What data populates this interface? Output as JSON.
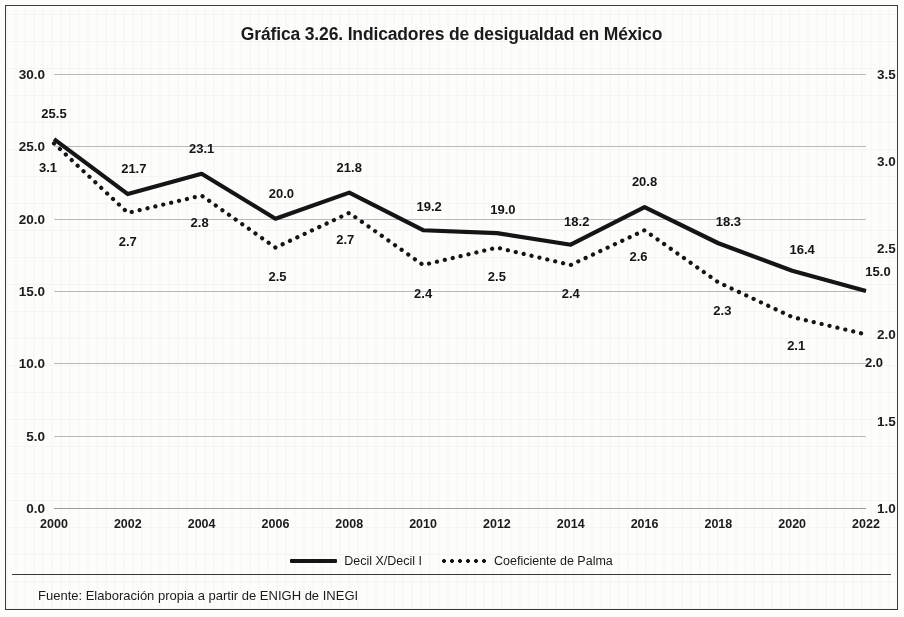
{
  "figure": {
    "title": "Gráfica 3.26. Indicadores de desigualdad en México",
    "source": "Fuente: Elaboración propia a partir de ENIGH de INEGI"
  },
  "legend": {
    "items": [
      {
        "label": "Decil X/Decil I",
        "marker": "solid-line-swatch",
        "color": "#151515"
      },
      {
        "label": "Coeficiente de Palma",
        "marker": "dotted-line-swatch",
        "color": "#151515"
      }
    ]
  },
  "chart_data": {
    "type": "line",
    "title": "Gráfica 3.26. Indicadores de desigualdad en México",
    "xlabel": "",
    "ylabel": "",
    "grid": true,
    "legend_position": "bottom",
    "x": [
      2000,
      2002,
      2004,
      2006,
      2008,
      2010,
      2012,
      2014,
      2016,
      2018,
      2020,
      2022
    ],
    "categories": [
      "2000",
      "2002",
      "2004",
      "2006",
      "2008",
      "2010",
      "2012",
      "2014",
      "2016",
      "2018",
      "2020",
      "2022"
    ],
    "axes": {
      "left": {
        "ylim": [
          0.0,
          30.0
        ],
        "ticks": [
          0.0,
          5.0,
          10.0,
          15.0,
          20.0,
          25.0,
          30.0
        ],
        "tick_labels": [
          "0.0",
          "5.0",
          "10.0",
          "15.0",
          "20.0",
          "25.0",
          "30.0"
        ]
      },
      "right": {
        "ylim": [
          1.0,
          3.5
        ],
        "ticks": [
          1.0,
          1.5,
          2.0,
          2.5,
          3.0,
          3.5
        ],
        "tick_labels": [
          "1.0",
          "1.5",
          "2.0",
          "2.5",
          "3.0",
          "3.5"
        ]
      }
    },
    "series": [
      {
        "name": "Decil X/Decil I",
        "axis": "left",
        "style": "solid",
        "color": "#151515",
        "values": [
          25.5,
          21.7,
          23.1,
          20.0,
          21.8,
          19.2,
          19.0,
          18.2,
          20.8,
          18.3,
          16.4,
          15.0
        ],
        "labels": [
          "25.5",
          "21.7",
          "23.1",
          "20.0",
          "21.8",
          "19.2",
          "19.0",
          "18.2",
          "20.8",
          "18.3",
          "16.4",
          "15.0"
        ],
        "label_offsets": [
          [
            0,
            -26
          ],
          [
            6,
            -26
          ],
          [
            0,
            -26
          ],
          [
            6,
            -26
          ],
          [
            0,
            -26
          ],
          [
            6,
            -24
          ],
          [
            6,
            -24
          ],
          [
            6,
            -24
          ],
          [
            0,
            -26
          ],
          [
            10,
            -22
          ],
          [
            10,
            -22
          ],
          [
            12,
            -20
          ]
        ]
      },
      {
        "name": "Coeficiente de Palma",
        "axis": "right",
        "style": "dotted",
        "color": "#151515",
        "values": [
          3.1,
          2.7,
          2.8,
          2.5,
          2.7,
          2.4,
          2.5,
          2.4,
          2.6,
          2.3,
          2.1,
          2.0
        ],
        "labels": [
          "3.1",
          "2.7",
          "2.8",
          "2.5",
          "2.7",
          "2.4",
          "2.5",
          "2.4",
          "2.6",
          "2.3",
          "2.1",
          "2.0"
        ],
        "label_offsets": [
          [
            -6,
            24
          ],
          [
            0,
            28
          ],
          [
            -2,
            26
          ],
          [
            2,
            28
          ],
          [
            -4,
            26
          ],
          [
            0,
            28
          ],
          [
            0,
            28
          ],
          [
            0,
            28
          ],
          [
            -6,
            26
          ],
          [
            4,
            28
          ],
          [
            4,
            28
          ],
          [
            8,
            28
          ]
        ]
      }
    ]
  }
}
